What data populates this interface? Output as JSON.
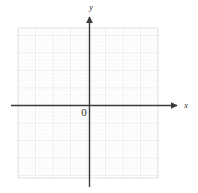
{
  "figure": {
    "kind": "cartesian-coordinate-plane",
    "width": 198,
    "height": 193,
    "background_color": "#ffffff"
  },
  "labels": {
    "x_axis": "x",
    "y_axis": "y",
    "origin": "0"
  },
  "colors": {
    "axis": "#3a3a3a",
    "major_grid": "#e2e2e2",
    "minor_grid": "#f0f0f0",
    "label_text": "#1a1a1a",
    "origin_text": "#2b2b2b",
    "background": "#ffffff"
  },
  "chart_data": {
    "type": "scatter",
    "title": "",
    "subtitle": "",
    "xlabel": "x",
    "ylabel": "y",
    "origin_label": "0",
    "grid": true,
    "grid_major_spacing_px": 17.5,
    "grid_minor_per_major": 5,
    "legend": null,
    "legend_position": "none",
    "xlim": [
      -4,
      4
    ],
    "ylim": [
      -4.5,
      4
    ],
    "xticks": [],
    "yticks": [],
    "xticklabels": [],
    "yticklabels": [],
    "annotations": [],
    "series": [],
    "x": [],
    "values": []
  },
  "geometry": {
    "grid": {
      "left": 18,
      "top": 28,
      "right": 158,
      "bottom": 178
    },
    "origin": {
      "x": 89,
      "y": 105
    },
    "x_axis": {
      "start_x": 11,
      "end_x": 178,
      "y": 105
    },
    "y_axis": {
      "x": 89,
      "top_y": 16,
      "bottom_y": 187
    },
    "x_label_pos": {
      "x": 186,
      "y": 108
    },
    "y_label_pos": {
      "x": 91,
      "y": 10
    },
    "origin_label_pos": {
      "x": 80,
      "y": 116
    }
  }
}
